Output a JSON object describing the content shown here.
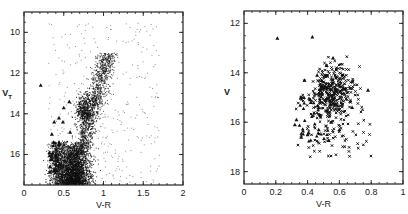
{
  "chart_data": [
    {
      "type": "scatter",
      "title": "",
      "xlabel": "V-R",
      "ylabel": "V_T",
      "xlim": [
        0,
        2
      ],
      "ylim": [
        17.5,
        9
      ],
      "x_ticks": [
        "0",
        "0.5",
        "1",
        "1.5",
        "2"
      ],
      "y_ticks": [
        "10",
        "12",
        "14",
        "16"
      ],
      "y_inverted": true,
      "grid": false,
      "legend": "none",
      "series": [
        {
          "name": "field stars (dots)",
          "marker": "dot",
          "description": "dense color-magnitude distribution: main concentration near V-R 0.45-0.8, V_T 15.5-17.5; red giant branch rising from V-R ~0.7 at V_T 16 to ~1.1 at V_T 11; sparse scatter up to V-R ~1.9"
        },
        {
          "name": "triangles",
          "marker": "triangle",
          "points": [
            [
              0.21,
              12.6
            ],
            [
              0.38,
              14.4
            ],
            [
              0.44,
              14.2
            ],
            [
              0.5,
              13.7
            ],
            [
              0.57,
              13.4
            ],
            [
              0.49,
              14.4
            ],
            [
              0.58,
              14.9
            ],
            [
              0.35,
              15.0
            ],
            [
              0.37,
              15.4
            ],
            [
              0.32,
              15.9
            ],
            [
              0.35,
              16.1
            ],
            [
              0.4,
              16.3
            ],
            [
              0.33,
              16.6
            ],
            [
              0.41,
              16.8
            ]
          ]
        }
      ]
    },
    {
      "type": "scatter",
      "title": "",
      "xlabel": "V-R",
      "ylabel": "V",
      "xlim": [
        0,
        1
      ],
      "ylim": [
        18.5,
        11.5
      ],
      "x_ticks": [
        "0",
        "0.2",
        "0.4",
        "0.6",
        "0.8",
        "1"
      ],
      "y_ticks": [
        "12",
        "14",
        "16",
        "18"
      ],
      "y_inverted": true,
      "grid": false,
      "legend": "none",
      "series": [
        {
          "name": "crosses",
          "marker": "x",
          "description": "clump centered near V-R 0.55, V 14.6; spread V-R 0.33-0.8, V 13.2-17.4"
        },
        {
          "name": "triangles",
          "marker": "triangle",
          "points": [
            [
              0.21,
              12.6
            ],
            [
              0.43,
              12.55
            ],
            [
              0.56,
              13.4
            ],
            [
              0.52,
              13.7
            ],
            [
              0.46,
              14.1
            ],
            [
              0.38,
              14.3
            ],
            [
              0.33,
              15.9
            ],
            [
              0.32,
              16.1
            ],
            [
              0.36,
              16.6
            ],
            [
              0.4,
              16.5
            ],
            [
              0.47,
              16.3
            ],
            [
              0.55,
              16.0
            ],
            [
              0.68,
              15.4
            ],
            [
              0.78,
              14.7
            ],
            [
              0.6,
              16.3
            ],
            [
              0.42,
              15.2
            ]
          ]
        }
      ]
    }
  ]
}
